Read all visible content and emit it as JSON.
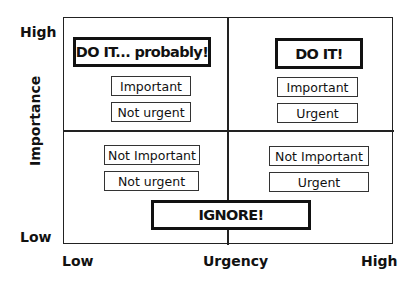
{
  "axes": {
    "y_title": "Importance",
    "y_high": "High",
    "y_low": "Low",
    "x_title": "Urgency",
    "x_low": "Low",
    "x_high": "High"
  },
  "quadrants": {
    "top_left": {
      "action": "DO IT... probably!",
      "tags": [
        "Important",
        "Not urgent"
      ]
    },
    "top_right": {
      "action": "DO IT!",
      "tags": [
        "Important",
        "Urgent"
      ]
    },
    "bottom_left": {
      "tags": [
        "Not Important",
        "Not urgent"
      ]
    },
    "bottom_right": {
      "tags": [
        "Not Important",
        "Urgent"
      ]
    },
    "bottom_action": "IGNORE!"
  },
  "colors": {
    "line": "#222222",
    "text": "#111111",
    "background": "#ffffff"
  }
}
